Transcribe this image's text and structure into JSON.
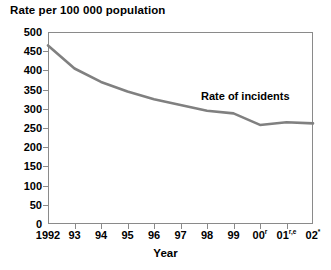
{
  "chart_data": {
    "type": "line",
    "title": "Rate per 100 000 population",
    "xlabel": "Year",
    "ylabel": "",
    "categories": [
      "1992",
      "93",
      "94",
      "95",
      "96",
      "97",
      "98",
      "99",
      "00",
      "01",
      "02"
    ],
    "category_markers": [
      "",
      "",
      "",
      "",
      "",
      "",
      "",
      "",
      "r",
      "r,e",
      "*"
    ],
    "series": [
      {
        "name": "Rate of incidents",
        "values": [
          465,
          405,
          370,
          345,
          325,
          310,
          295,
          288,
          258,
          265,
          262
        ],
        "color": "#808080"
      }
    ],
    "ylim": [
      0,
      500
    ],
    "ytick_step": 50,
    "yticks": [
      0,
      50,
      100,
      150,
      200,
      250,
      300,
      350,
      400,
      450,
      500
    ],
    "grid": false,
    "legend_position": "inline-annotation",
    "annotations": [
      {
        "text": "Rate of incidents",
        "x_category": "98",
        "value": 330
      }
    ]
  },
  "chart": {
    "title": "Rate per 100 000 population",
    "x_axis_title": "Year",
    "series_label": "Rate of incidents"
  }
}
